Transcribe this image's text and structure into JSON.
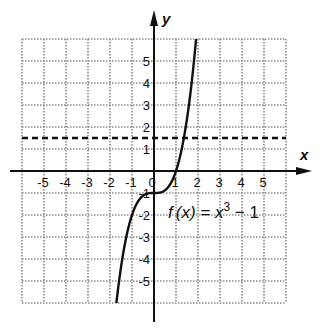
{
  "chart_data": {
    "type": "line",
    "title": "",
    "xlabel": "x",
    "ylabel": "y",
    "xlim": [
      -6,
      6
    ],
    "ylim": [
      -6,
      6
    ],
    "grid": true,
    "x_tick_labels": [
      "-5",
      "-4",
      "-3",
      "-2",
      "-1",
      "0",
      "1",
      "2",
      "3",
      "4",
      "5"
    ],
    "y_tick_labels": [
      "5",
      "4",
      "3",
      "2",
      "1",
      "-1",
      "-2",
      "-3",
      "-4",
      "-5"
    ],
    "series": [
      {
        "name": "f(x) = x^3 - 1",
        "style": "solid",
        "x": [
          -1.71,
          -1.5,
          -1.25,
          -1,
          -0.75,
          -0.5,
          -0.25,
          0,
          0.25,
          0.5,
          0.75,
          1,
          1.25,
          1.5,
          1.75,
          1.91
        ],
        "y": [
          -6,
          -4.38,
          -2.95,
          -2,
          -1.42,
          -1.13,
          -1.02,
          -1,
          -0.98,
          -0.88,
          -0.58,
          0,
          0.95,
          2.38,
          4.36,
          6
        ]
      },
      {
        "name": "horizontal dashed line",
        "style": "dashed",
        "x": [
          -6,
          6
        ],
        "y": [
          1.5,
          1.5
        ]
      }
    ],
    "annotations": [
      {
        "text": "f(x) = x³ − 1",
        "x": 2.5,
        "y": -1.5
      }
    ]
  },
  "labels": {
    "x_axis": "x",
    "y_axis": "y",
    "func_prefix": "f",
    "func_paren": "(x) = x",
    "func_exp": "3",
    "func_suffix": " − 1",
    "origin": "0"
  }
}
